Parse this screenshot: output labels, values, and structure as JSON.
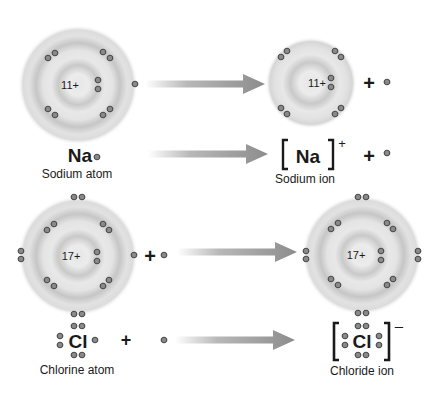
{
  "colors": {
    "shell_light": "#ececec",
    "shell_dark": "#c4c4c4",
    "electron_fill": "#8a8a8a",
    "electron_stroke": "#4a4a4a",
    "arrow_start": "#ffffff",
    "arrow_end": "#8c8c8c",
    "text": "#1a1a1a"
  },
  "sodium": {
    "atom": {
      "nucleus_label": "11+",
      "symbol": "Na",
      "caption": "Sodium atom"
    },
    "ion": {
      "nucleus_label": "11+",
      "symbol": "Na",
      "charge": "+",
      "caption": "Sodium ion"
    },
    "plus_sign": "+",
    "released_electron": "e-"
  },
  "chlorine": {
    "atom": {
      "nucleus_label": "17+",
      "symbol": "Cl",
      "caption": "Chlorine atom"
    },
    "ion": {
      "nucleus_label": "17+",
      "symbol": "Cl",
      "charge": "–",
      "caption": "Chloride ion"
    },
    "plus_sign": "+",
    "gained_electron": "e-"
  }
}
